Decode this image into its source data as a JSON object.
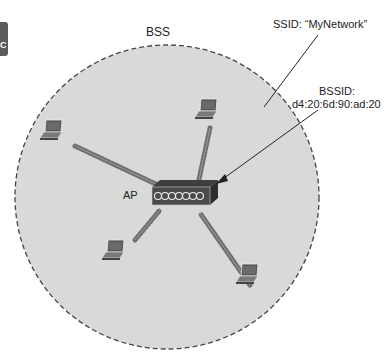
{
  "diagram": {
    "bss_label": "BSS",
    "ssid_label": "SSID: “MyNetwork”",
    "bssid_title": "BSSID:",
    "bssid_value": "d4:20:6d:90:ad:20",
    "ap_label": "AP",
    "side_tab_letter": "C",
    "nodes": [
      {
        "type": "access-point",
        "label": "AP"
      },
      {
        "type": "laptop",
        "position": "upper-left"
      },
      {
        "type": "laptop",
        "position": "upper-right"
      },
      {
        "type": "laptop",
        "position": "lower-left"
      },
      {
        "type": "laptop",
        "position": "lower-right"
      }
    ],
    "colors": {
      "bss_fill": "#d9d9d9",
      "bss_border": "#444444",
      "device": "#4a4a4a"
    }
  }
}
